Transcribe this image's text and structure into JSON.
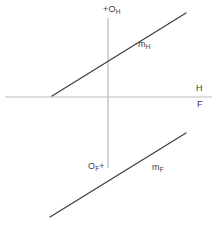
{
  "figure": {
    "width": 217,
    "height": 229,
    "background": "#ffffff"
  },
  "labels": {
    "origin_h": "O",
    "origin_h_sub": "H",
    "origin_h_mark": "+",
    "origin_f": "O",
    "origin_f_sub": "F",
    "origin_f_mark": "+",
    "plane_h": "H",
    "plane_f": "F",
    "line_mh": "m",
    "line_mh_sub": "H",
    "line_mf": "m",
    "line_mf_sub": "F"
  },
  "colors": {
    "background": "#ffffff",
    "axis": "#c9c9c9",
    "ground_line": "#d2d2d2",
    "object_line": "#3f3f3f",
    "text": "#3c3c3c"
  },
  "geometry": {
    "ground_line": {
      "x1": 5,
      "y1": 97,
      "x2": 212,
      "y2": 97
    },
    "vertical_axis": {
      "x1": 108,
      "y1": 18,
      "x2": 108,
      "y2": 168
    },
    "line_mh": {
      "x1": 52,
      "y1": 96,
      "x2": 186,
      "y2": 13
    },
    "line_mf": {
      "x1": 50,
      "y1": 217,
      "x2": 186,
      "y2": 133
    }
  }
}
